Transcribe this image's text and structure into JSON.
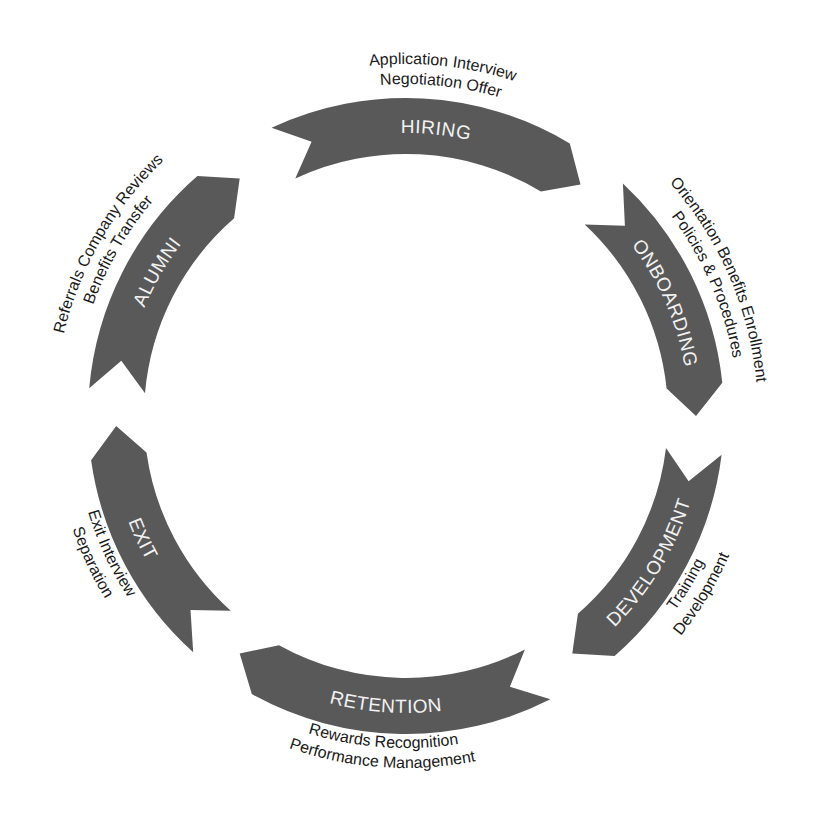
{
  "diagram": {
    "center": [
      406,
      416
    ],
    "outer_radius": 318,
    "inner_radius": 262,
    "fill_color": "#595959",
    "label_color": "#f2f2f2",
    "text_color": "#1a1a1a",
    "stages": [
      {
        "name": "HIRING",
        "start_deg": -25,
        "end_deg": 37,
        "details": [
          "Application Interview",
          "Negotiation Offer"
        ]
      },
      {
        "name": "ONBOARDING",
        "start_deg": 43,
        "end_deg": 90,
        "details": [
          "Orientation Benefits Enrollment",
          "Policies & Procedures"
        ]
      },
      {
        "name": "DEVELOPMENT",
        "start_deg": 97,
        "end_deg": 145,
        "details": [
          "Training",
          "Development"
        ]
      },
      {
        "name": "RETENTION",
        "start_deg": 153,
        "end_deg": 215,
        "details": [
          "Rewards Recognition",
          "Performance Management"
        ]
      },
      {
        "name": "EXIT",
        "start_deg": 222,
        "end_deg": 268,
        "details": [
          "Exit Interview",
          "Separation"
        ]
      },
      {
        "name": "ALUMNI",
        "start_deg": 275,
        "end_deg": 325,
        "details": [
          "Referrals Company Reviews",
          "Benefits Transfer"
        ]
      }
    ]
  }
}
